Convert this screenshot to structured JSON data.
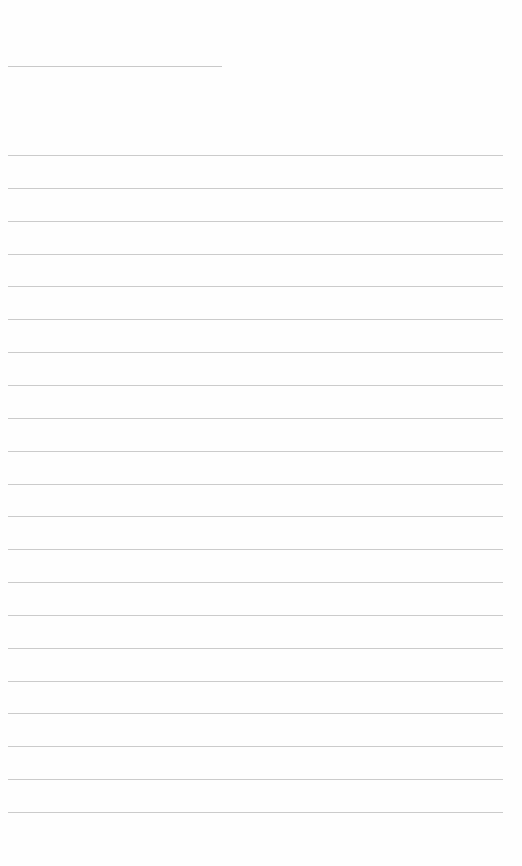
{
  "page": {
    "type": "blank lined sheet",
    "title_line": {
      "label": ""
    },
    "ruled_lines": {
      "count": 21,
      "first_y": 155,
      "spacing": 32.85,
      "color": "#cbcbcb"
    },
    "background": "#fefefe",
    "text_lines": [
      "",
      "",
      "",
      "",
      "",
      "",
      "",
      "",
      "",
      "",
      "",
      "",
      "",
      "",
      "",
      "",
      "",
      "",
      "",
      "",
      ""
    ]
  }
}
